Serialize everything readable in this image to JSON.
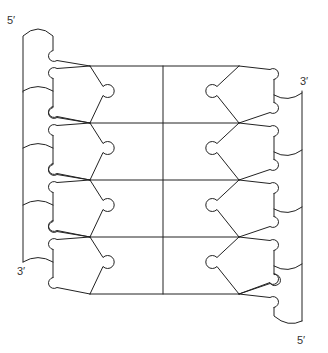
{
  "figure": {
    "stroke_color": "#222222",
    "background": "#ffffff"
  },
  "labels": {
    "left_top": "5′",
    "left_bottom": "3′",
    "right_top": "3′",
    "right_bottom": "5′"
  },
  "strands": {
    "left": {
      "direction": "5′ to 3′ (top to bottom)",
      "nucleotides": 4
    },
    "right": {
      "direction": "3′ to 5′ (top to bottom)",
      "nucleotides": 4
    }
  },
  "geometry": {
    "row_spacing": 57,
    "rows_y": [
      66,
      123,
      180,
      237
    ],
    "left_vertex_x": 90,
    "right_vertex_x": 239,
    "center_x": 163,
    "left_backbone_x": 23,
    "left_inner_x": 53,
    "right_backbone_x": 302,
    "right_inner_x": 274
  }
}
